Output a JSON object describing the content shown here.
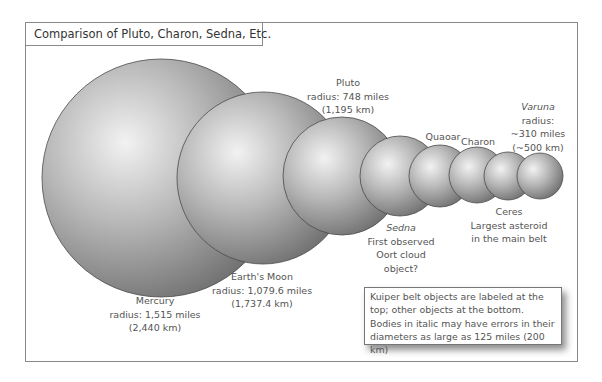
{
  "title": "Comparison of Pluto, Charon, Sedna, Etc.",
  "colors": {
    "frame_border": "#8a8a8a",
    "sphere_highlight": "#f2f2f2",
    "sphere_mid": "#b4b4b4",
    "sphere_shadow": "#6e6e6e",
    "text": "#555555"
  },
  "bodies": [
    {
      "name": "Mercury",
      "cx": 161,
      "cy": 178,
      "r": 119,
      "label": {
        "line1": "Mercury",
        "line2": "radius: 1,515 miles",
        "line3": "(2,440 km)",
        "italic": false,
        "position": "bottom"
      }
    },
    {
      "name": "Earth's Moon",
      "cx": 263,
      "cy": 178,
      "r": 86,
      "label": {
        "line1": "Earth's Moon",
        "line2": "radius: 1,079.6 miles",
        "line3": "(1,737.4 km)",
        "italic": false,
        "position": "bottom"
      }
    },
    {
      "name": "Pluto",
      "cx": 342,
      "cy": 176,
      "r": 59,
      "label": {
        "line1": "Pluto",
        "line2": "radius: 748 miles",
        "line3": "(1,195 km)",
        "italic": false,
        "position": "top"
      }
    },
    {
      "name": "Sedna",
      "cx": 400,
      "cy": 176,
      "r": 40,
      "label": {
        "line1": "Sedna",
        "line2": "First observed",
        "line3": "Oort cloud",
        "line4": "object?",
        "italic": true,
        "position": "bottom"
      }
    },
    {
      "name": "Quaoar",
      "cx": 440,
      "cy": 176,
      "r": 31,
      "label": {
        "line1": "Quaoar",
        "italic": false,
        "position": "top"
      }
    },
    {
      "name": "Charon",
      "cx": 477,
      "cy": 175,
      "r": 28,
      "label": {
        "line1": "Charon",
        "italic": false,
        "position": "top"
      }
    },
    {
      "name": "Ceres",
      "cx": 508,
      "cy": 176,
      "r": 24,
      "label": {
        "line1": "Ceres",
        "line2": "Largest asteroid",
        "line3": "in the main belt",
        "italic": false,
        "position": "bottom"
      }
    },
    {
      "name": "Varuna",
      "cx": 540,
      "cy": 176,
      "r": 23,
      "label": {
        "line1": "Varuna",
        "line2": "radius:",
        "line3": "~310 miles",
        "line4": "(~500 km)",
        "italic": true,
        "position": "top"
      }
    }
  ],
  "note": "Kuiper belt objects are labeled at the top; other objects at the bottom. Bodies in italic may have errors in their diameters as large as 125 miles (200 km)"
}
